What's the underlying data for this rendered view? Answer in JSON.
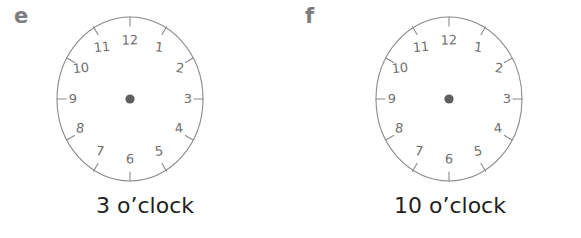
{
  "page": {
    "background_color": "#ffffff",
    "width": 581,
    "height": 238
  },
  "style": {
    "clock_stroke_color": "#8a8a8a",
    "numeral_color": "#6f6f6f",
    "center_dot_color": "#5e5e5e",
    "caption_color": "#231f20",
    "panel_letter_color": "#7c7c7c"
  },
  "panels": [
    {
      "letter": "e",
      "caption": "3 o’clock",
      "clock": {
        "numerals": [
          "1",
          "2",
          "3",
          "4",
          "5",
          "6",
          "7",
          "8",
          "9",
          "10",
          "11",
          "12"
        ],
        "tick_count": 12,
        "hands": [],
        "center_dot": true
      }
    },
    {
      "letter": "f",
      "caption": "10 o’clock",
      "clock": {
        "numerals": [
          "1",
          "2",
          "3",
          "4",
          "5",
          "6",
          "7",
          "8",
          "9",
          "10",
          "11",
          "12"
        ],
        "tick_count": 12,
        "hands": [],
        "center_dot": true
      }
    }
  ]
}
